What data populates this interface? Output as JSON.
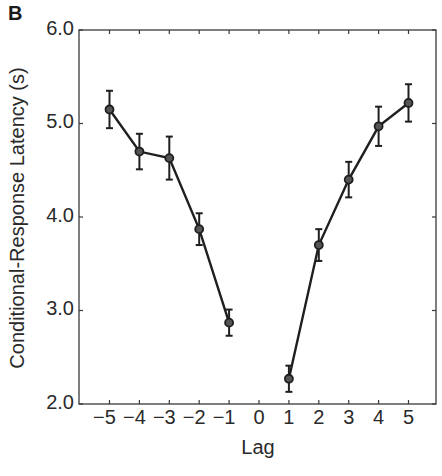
{
  "panel": {
    "label": "B"
  },
  "axes": {
    "xlabel": "Lag",
    "ylabel": "Conditional-Response Latency (s)",
    "yticks": [
      "6.0",
      "5.0",
      "4.0",
      "3.0",
      "2.0"
    ],
    "xticks": [
      "−5",
      "−4",
      "−3",
      "−2",
      "−1",
      "0",
      "1",
      "2",
      "3",
      "4",
      "5"
    ]
  },
  "chart_data": {
    "type": "line",
    "title": "",
    "panel_label": "B",
    "xlabel": "Lag",
    "ylabel": "Conditional-Response Latency (s)",
    "xlim": [
      -6,
      6
    ],
    "ylim": [
      2.0,
      6.0
    ],
    "xticks": [
      -5,
      -4,
      -3,
      -2,
      -1,
      0,
      1,
      2,
      3,
      4,
      5
    ],
    "yticks": [
      2.0,
      3.0,
      4.0,
      5.0,
      6.0
    ],
    "grid": false,
    "legend": null,
    "series": [
      {
        "name": "Negative lags",
        "x": [
          -5,
          -4,
          -3,
          -2,
          -1
        ],
        "values": [
          5.15,
          4.7,
          4.63,
          3.87,
          2.87
        ],
        "error": [
          0.2,
          0.19,
          0.23,
          0.17,
          0.14
        ]
      },
      {
        "name": "Positive lags",
        "x": [
          1,
          2,
          3,
          4,
          5
        ],
        "values": [
          2.27,
          3.7,
          4.4,
          4.97,
          5.22
        ],
        "error": [
          0.14,
          0.17,
          0.19,
          0.21,
          0.2
        ]
      }
    ],
    "colors": {
      "line": "#1f1f1f",
      "axis": "#3a3a3a"
    }
  }
}
